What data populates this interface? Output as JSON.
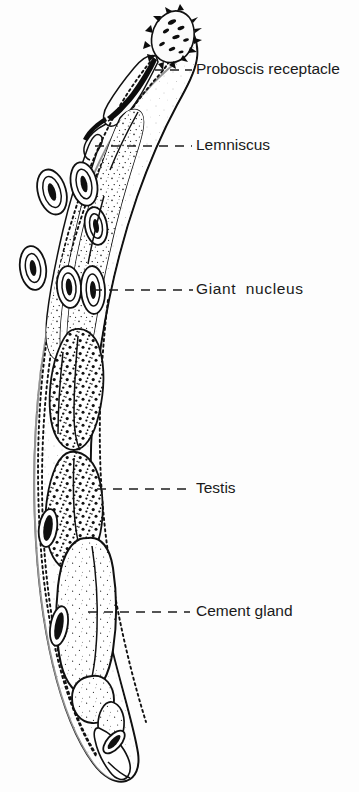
{
  "figure": {
    "kind": "biological-anatomy-diagram",
    "orientation": "proboscis at top, posterior at bottom",
    "background_color": "#fdfdfd",
    "ink_color": "#111111"
  },
  "labels": [
    {
      "id": "proboscis-receptacle",
      "text": "Proboscis receptacle",
      "text_x": 196,
      "text_y": 70,
      "leader": {
        "x1": 155,
        "y1": 70,
        "x2": 192,
        "y2": 70,
        "style": "dashed",
        "dash": "9 6"
      }
    },
    {
      "id": "lemniscus",
      "text": "Lemniscus",
      "text_x": 196,
      "text_y": 146,
      "leader": {
        "x1": 95,
        "y1": 146,
        "x2": 192,
        "y2": 146,
        "style": "dashed",
        "dash": "9 7"
      }
    },
    {
      "id": "giant-nucleus",
      "text": "Giant  nucleus",
      "text_x": 196,
      "text_y": 290,
      "spaced": true,
      "leader": {
        "x1": 93,
        "y1": 290,
        "x2": 193,
        "y2": 290,
        "style": "dashed",
        "dash": "9 7"
      }
    },
    {
      "id": "testis",
      "text": "Testis",
      "text_x": 196,
      "text_y": 489,
      "leader": {
        "x1": 97,
        "y1": 489,
        "x2": 193,
        "y2": 489,
        "style": "dashed",
        "dash": "9 7"
      }
    },
    {
      "id": "cement-gland",
      "text": "Cement gland",
      "text_x": 196,
      "text_y": 612,
      "leader": {
        "x1": 88,
        "y1": 612,
        "x2": 190,
        "y2": 612,
        "style": "dashed",
        "dash": "9 7"
      }
    }
  ],
  "structures": {
    "body_wall": "outer cuticle outline, S-curved elongate body",
    "body_lining": "dotted inner lining following body wall",
    "proboscis": "bulbous anterior tip armed with recurved hooks",
    "proboscis_receptacle": "muscular sac behind proboscis",
    "lemnisci": "paired elongate stippled sacs descending from neck",
    "giant_nuclei": "concentric oval nuclei with dark elongate cores in body wall",
    "testes": "two densely speckled oval bodies in mid-body",
    "cement_gland": "large elongate lightly stippled gland posterior to testes",
    "posterior_organs": "rounded bursal/terminal structures at posterior end"
  }
}
